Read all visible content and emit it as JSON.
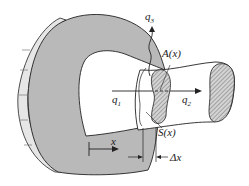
{
  "diagram": {
    "labels": {
      "q1": "q",
      "q1_sub": "1",
      "q2": "q",
      "q2_sub": "2",
      "q3": "q",
      "q3_sub": "3",
      "area": "A(x)",
      "surface": "S(x)",
      "x_axis": "x",
      "delta_x": "Δx"
    },
    "colors": {
      "body_fill": "#b9b9b9",
      "line": "#222222",
      "background": "#ffffff",
      "wall_fill": "#e6e6e6"
    }
  }
}
